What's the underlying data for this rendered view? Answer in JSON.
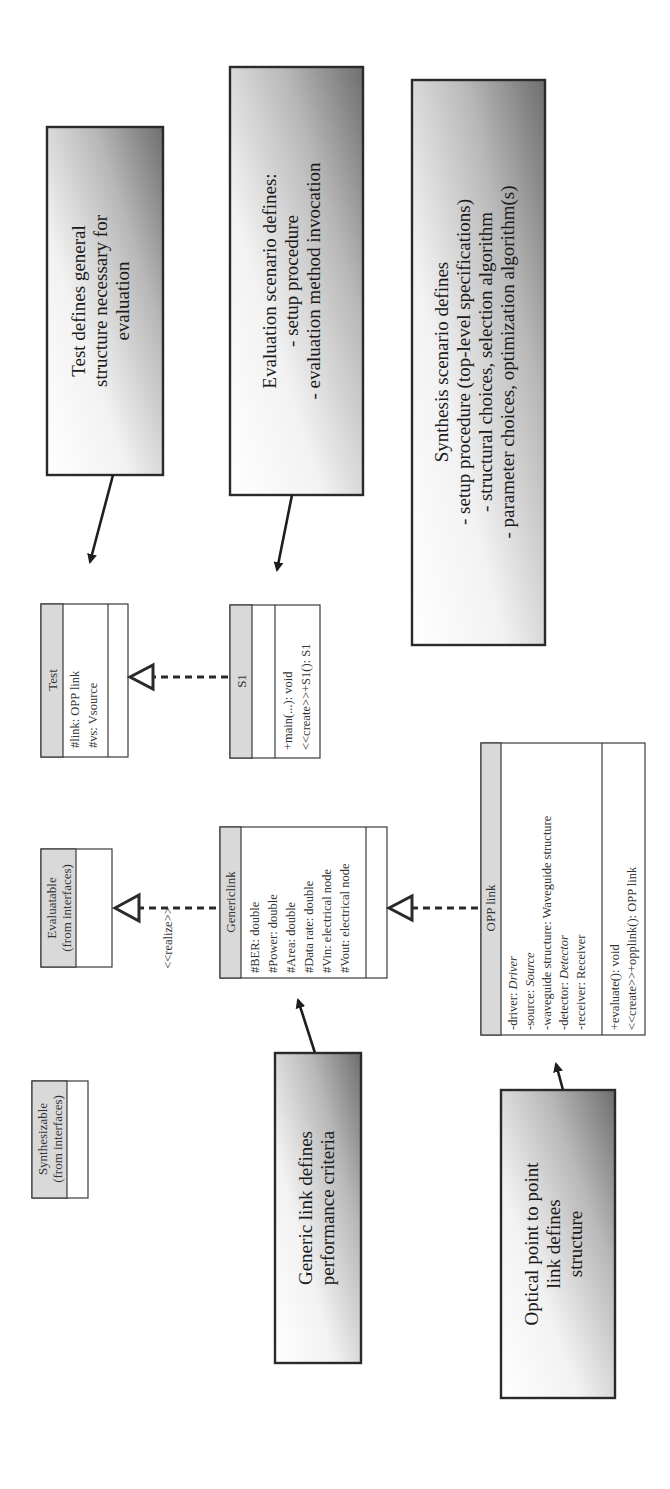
{
  "notes": {
    "test": {
      "lines": [
        "Test defines general",
        "structure necessary for",
        "evaluation"
      ]
    },
    "evaluation": {
      "lines": [
        "Evaluation scenario defines:",
        "- setup procedure",
        "- evaluation method invocation"
      ]
    },
    "synthesis": {
      "lines": [
        "Synthesis scenario defines",
        "- setup procedure (top-level specifications)",
        "- structural choices, selection algorithm",
        "- parameter choices, optimization algorithm(s)"
      ]
    },
    "generic_link": {
      "lines": [
        "Generic link defines",
        "performance criteria"
      ]
    },
    "optical": {
      "lines": [
        "Optical point to point",
        "link defines",
        "structure"
      ]
    }
  },
  "classes": {
    "test": {
      "name": "Test",
      "attributes": [
        "#link: OPP link",
        "#vs: Vsource"
      ],
      "operations": []
    },
    "s1": {
      "name": "S1",
      "attributes": [],
      "operations": [
        "+main(...): void",
        "<<create>>+S1(): S1"
      ]
    },
    "evaluatable": {
      "name_lines": [
        "Evaluatable",
        "(from interfaces)"
      ]
    },
    "synthesizable": {
      "name_lines": [
        "Synthesizable",
        "(from interfaces)"
      ]
    },
    "genericlink": {
      "name": "Genericlink",
      "attributes": [
        "#BER: double",
        "#Power: double",
        "#Area: double",
        "#Data rate: double",
        "#Vin: electrical node",
        "#Vout: electrical node"
      ],
      "operations": []
    },
    "opplink": {
      "name": "OPP link",
      "attributes": [
        {
          "name": "-driver: ",
          "type": "Driver",
          "italic": true
        },
        {
          "name": "-source: ",
          "type": "Source",
          "italic": true
        },
        {
          "name": "-waveguide structure: ",
          "type": "Waveguide structure",
          "italic": false
        },
        {
          "name": "-detector: ",
          "type": "Detector",
          "italic": true
        },
        {
          "name": "-receiver: ",
          "type": "Receiver",
          "italic": false
        }
      ],
      "operations": [
        "+evaluate(): void",
        "<<create>>+opplink(): OPP link"
      ]
    }
  },
  "relations": {
    "realize_label": "<<realize>>"
  },
  "colors": {
    "note_light": "#ffffff",
    "note_dark": "#7a7a7a",
    "class_header": "#d9d9d9",
    "line": "#2a2a2a"
  }
}
